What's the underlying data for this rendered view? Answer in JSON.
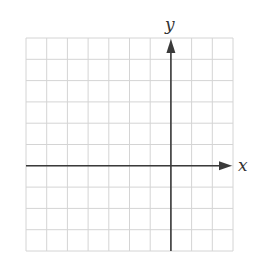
{
  "diagram": {
    "type": "coordinate-grid",
    "x_label": "x",
    "y_label": "y",
    "grid": {
      "columns": 10,
      "rows": 10,
      "y_axis_column": 7,
      "x_axis_row": 6
    },
    "colors": {
      "grid": "#d4d4d4",
      "axis": "#3a3a3a",
      "background": "#ffffff"
    }
  }
}
